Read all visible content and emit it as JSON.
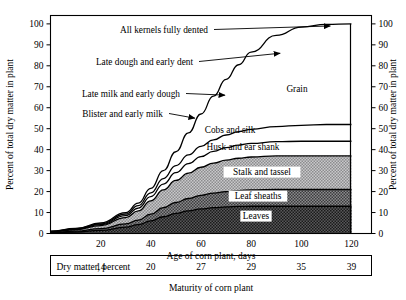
{
  "chart_data": {
    "type": "area",
    "title": "",
    "subtitle": "",
    "xlabel": "Age of corn plant, days",
    "ylabel": "Percent of total dry matter in plant",
    "ylabel_right": "Percent of total dry matter in plant",
    "caption": "Maturity of corn plant",
    "xlim": [
      0,
      128
    ],
    "ylim": [
      0,
      104
    ],
    "grid": false,
    "legend": "inline-band-labels",
    "xticks": [
      20,
      40,
      60,
      80,
      100,
      120
    ],
    "yticks": [
      0,
      10,
      20,
      30,
      40,
      50,
      60,
      70,
      80,
      90,
      100
    ],
    "x": [
      0,
      10,
      20,
      30,
      35,
      40,
      45,
      50,
      55,
      60,
      65,
      70,
      75,
      80,
      90,
      100,
      110,
      120
    ],
    "stacking": "cumulative-top-of-band",
    "series": [
      {
        "name": "Leaves",
        "fill": "#4a4a4a",
        "cumulative_top": [
          0.3,
          0.7,
          1.5,
          3.0,
          4.2,
          6.0,
          8.0,
          9.6,
          10.8,
          11.7,
          12.3,
          12.7,
          12.9,
          13.0,
          13.0,
          13.0,
          13.0,
          13.0
        ]
      },
      {
        "name": "Leaf sheaths",
        "fill": "#6e6e6e",
        "cumulative_top": [
          0.5,
          1.1,
          2.3,
          4.6,
          6.4,
          9.2,
          12.3,
          14.8,
          16.7,
          18.2,
          19.3,
          20.0,
          20.5,
          20.8,
          21.0,
          21.0,
          21.0,
          21.0
        ]
      },
      {
        "name": "Stalk and tassel",
        "fill": "#b4b4b4",
        "cumulative_top": [
          0.8,
          1.8,
          3.8,
          7.6,
          10.8,
          15.6,
          20.8,
          25.3,
          28.8,
          31.6,
          33.6,
          35.0,
          35.9,
          36.5,
          37.0,
          37.0,
          37.0,
          37.0
        ]
      },
      {
        "name": "Husk and ear shank",
        "fill": "#ffffff",
        "cumulative_top": [
          0.9,
          2.0,
          4.2,
          8.5,
          12.1,
          17.6,
          23.6,
          29.0,
          33.3,
          36.7,
          39.2,
          41.0,
          42.2,
          43.0,
          43.8,
          44.0,
          44.0,
          44.0
        ]
      },
      {
        "name": "Cobs and silk",
        "fill": "#ffffff",
        "cumulative_top": [
          1.0,
          2.2,
          4.6,
          9.3,
          13.3,
          19.4,
          26.2,
          32.4,
          37.5,
          41.6,
          44.7,
          47.0,
          48.6,
          49.7,
          51.0,
          51.6,
          52.0,
          52.0
        ]
      },
      {
        "name": "Grain",
        "fill": "#ffffff",
        "cumulative_top": [
          1.1,
          2.4,
          5.0,
          10.0,
          14.5,
          21.5,
          30.0,
          39.0,
          48.0,
          57.0,
          65.5,
          73.5,
          80.5,
          86.5,
          94.5,
          98.5,
          99.8,
          100.0
        ]
      }
    ],
    "annotations": [
      {
        "text": "All kernels fully dented",
        "target_x": 112,
        "target_y": 99
      },
      {
        "text": "Late dough and early dent",
        "target_x": 92,
        "target_y": 86
      },
      {
        "text": "Late milk and early dough",
        "target_x": 70,
        "target_y": 66
      },
      {
        "text": "Blister and early milk",
        "target_x": 58,
        "target_y": 55
      }
    ],
    "band_labels": [
      "Grain",
      "Cobs and silk",
      "Husk and ear shank",
      "Stalk and tassel",
      "Leaf sheaths",
      "Leaves"
    ],
    "dry_matter": {
      "row_label": "Dry matter, percent",
      "at_x": [
        20,
        40,
        60,
        80,
        100,
        120
      ],
      "values": [
        "14",
        "20",
        "27",
        "29",
        "35",
        "39"
      ]
    }
  }
}
